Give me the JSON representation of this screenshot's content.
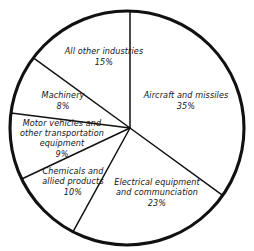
{
  "chart_data": {
    "type": "pie",
    "title": "",
    "subtitle": "",
    "xlabel": "",
    "ylabel": "",
    "legend_position": "none",
    "grid": false,
    "value_unit": "percent",
    "total": 100,
    "start_angle_deg": 0,
    "direction": "clockwise",
    "categories": [
      "Aircraft and missiles",
      "Electrical equipment and communciation",
      "Chemicals and allied products",
      "Motor vehicles and other transportation equipment",
      "Machinery",
      "All other industries"
    ],
    "values": [
      35,
      23,
      10,
      9,
      8,
      15
    ],
    "slices": [
      {
        "id": "aircraft",
        "lines": [
          "Aircraft and missiles"
        ],
        "percent_label": "35%",
        "value": 35,
        "start_deg": 0,
        "end_deg": 126,
        "label_x": 186,
        "label_y": 101
      },
      {
        "id": "electrical",
        "lines": [
          "Electrical equipment",
          "and communciation"
        ],
        "percent_label": "23%",
        "value": 23,
        "start_deg": 126,
        "end_deg": 208.8,
        "label_x": 157,
        "label_y": 193
      },
      {
        "id": "chemicals",
        "lines": [
          "Chemicals and",
          "allied products"
        ],
        "percent_label": "10%",
        "value": 10,
        "start_deg": 208.8,
        "end_deg": 244.8,
        "label_x": 73,
        "label_y": 182
      },
      {
        "id": "motor-vehicles",
        "lines": [
          "Motor vehicles and",
          "other transportation",
          "equipment"
        ],
        "percent_label": "9%",
        "value": 9,
        "start_deg": 244.8,
        "end_deg": 277.2,
        "label_x": 62,
        "label_y": 139
      },
      {
        "id": "machinery",
        "lines": [
          "Machinery"
        ],
        "percent_label": "8%",
        "value": 8,
        "start_deg": 277.2,
        "end_deg": 306,
        "label_x": 63,
        "label_y": 101
      },
      {
        "id": "all-other",
        "lines": [
          "All other industries"
        ],
        "percent_label": "15%",
        "value": 15,
        "start_deg": 306,
        "end_deg": 360,
        "label_x": 104,
        "label_y": 57
      }
    ],
    "geometry": {
      "circle_center_x": 127,
      "circle_center_y": 128,
      "circle_radius": 117,
      "hub_x": 130,
      "hub_y": 128
    },
    "colors": {
      "slice_fill": "#ffffff",
      "outline": "#111111",
      "divider": "#111111",
      "text": "#141414",
      "background": "#ffffff"
    }
  }
}
